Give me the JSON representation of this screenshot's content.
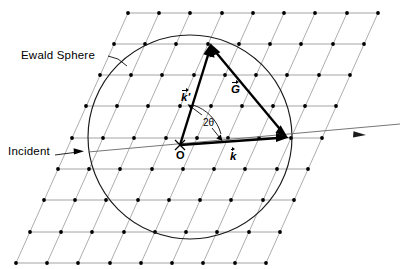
{
  "figure": {
    "type": "crystallography-diagram",
    "width": 401,
    "height": 269,
    "background_color": "#ffffff"
  },
  "labels": {
    "ewald_sphere": "Ewald Sphere",
    "incident": "Incident",
    "origin": "O",
    "angle": "2θ",
    "k_prime_symbol": "k'",
    "g_symbol": "G",
    "k_symbol": "k"
  },
  "colors": {
    "lattice_line": "#8a8a8a",
    "lattice_dot": "#000000",
    "circle_stroke": "#1a1a1a",
    "vector_stroke": "#000000",
    "incident_ray": "#6f6f6f",
    "text": "#000000"
  },
  "geometry": {
    "ewald_circle": {
      "center_x": 190,
      "center_y": 137,
      "radius": 102
    },
    "origin_point": {
      "x": 180,
      "y": 145
    },
    "k_prime_tip": {
      "x": 211,
      "y": 44
    },
    "k_tip": {
      "x": 287,
      "y": 137
    },
    "incident_ray": {
      "start_x": 88,
      "start_y": 152,
      "end_x": 400,
      "end_y": 124,
      "arrow_at_x": 360,
      "arrow_at_y": 135
    },
    "lattice": {
      "rows": 9,
      "cols": 9,
      "row_spacing": 31.2,
      "col_spacing": 31.2,
      "shear_dx": -14.0,
      "origin_x": 128,
      "origin_y": 13
    },
    "angle_arc": {
      "center_x": 180,
      "center_y": 145,
      "radius": 42,
      "start_deg": -72,
      "end_deg": -8
    }
  },
  "vectors": [
    {
      "name": "k-prime",
      "label": "k'",
      "from": "O",
      "to": "reciprocal-lattice-point",
      "arrow": true
    },
    {
      "name": "G",
      "label": "G",
      "from": "reciprocal-lattice-point",
      "to": "k-tip",
      "arrow": true
    },
    {
      "name": "k",
      "label": "k",
      "from": "O",
      "to": "sphere-edge",
      "arrow": true
    }
  ],
  "annotations": [
    {
      "name": "ewald-sphere-leader",
      "target": "ewald-circle"
    },
    {
      "name": "incident-leader",
      "target": "incident-ray"
    },
    {
      "name": "angle-leader-upper",
      "target": "k-prime-vector"
    },
    {
      "name": "angle-leader-lower",
      "target": "k-vector"
    }
  ]
}
